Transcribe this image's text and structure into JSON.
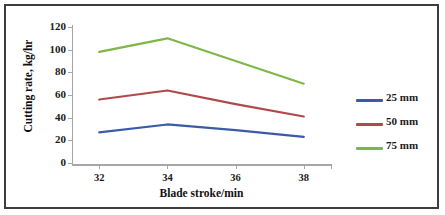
{
  "chart_data": {
    "type": "line",
    "title": "",
    "xlabel": "Blade stroke/min",
    "ylabel": "Cutting rate, kg/hr",
    "x": [
      32,
      34,
      36,
      38
    ],
    "categories": [
      "32",
      "34",
      "36",
      "38"
    ],
    "xticklabels": [
      "32",
      "34",
      "36",
      "38"
    ],
    "yticklabels": [
      "0",
      "20",
      "40",
      "60",
      "80",
      "100",
      "120"
    ],
    "yticks": [
      0,
      20,
      40,
      60,
      80,
      100,
      120
    ],
    "ylim": [
      0,
      120
    ],
    "xlim": [
      31.2,
      38.8
    ],
    "grid": false,
    "legend_position": "right",
    "series": [
      {
        "name": "25 mm",
        "color": "#3a5ba8",
        "values": [
          27,
          34,
          29,
          23
        ]
      },
      {
        "name": "50 mm",
        "color": "#b04a4a",
        "values": [
          56,
          64,
          52,
          41
        ]
      },
      {
        "name": "75 mm",
        "color": "#7fb648",
        "values": [
          98,
          110,
          90,
          70
        ]
      }
    ]
  },
  "legend": {
    "items": [
      {
        "label": "25 mm",
        "color": "#3a5ba8"
      },
      {
        "label": "50 mm",
        "color": "#b04a4a"
      },
      {
        "label": "75 mm",
        "color": "#7fb648"
      }
    ]
  },
  "axes": {
    "y_title": "Cutting rate, kg/hr",
    "x_title": "Blade stroke/min",
    "y_labels": [
      "120",
      "100",
      "80",
      "60",
      "40",
      "20",
      "0"
    ],
    "x_labels": [
      "32",
      "34",
      "36",
      "38"
    ]
  },
  "colors": {
    "border": "#3d3d3d",
    "axis": "#a6a6a6",
    "text": "#1a1a1a",
    "background": "#ffffff"
  }
}
